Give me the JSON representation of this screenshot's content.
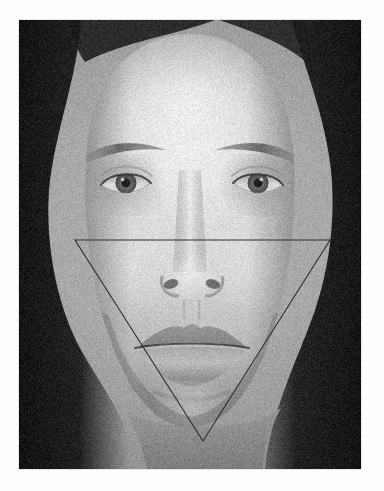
{
  "page": {
    "background_color": "#fdfdfd",
    "width": 384,
    "height": 491,
    "type": "annotated-photograph"
  },
  "photo": {
    "name": "frontal-face-portrait",
    "description": "Grayscale frontal portrait photograph of a woman's face, neutral expression, hair pulled back, dark background at left and right edges",
    "color_mode": "grayscale",
    "frame": {
      "x": 19,
      "y": 20,
      "width": 342,
      "height": 449
    },
    "border_color": "#c8c8c8",
    "tones": {
      "background_dark": "#1c1c1c",
      "hair_dark": "#232323",
      "skin_midtone": "#b9b9b9",
      "skin_highlight": "#e3e3e3",
      "shadow": "#7a7a7a"
    }
  },
  "overlay": {
    "name": "inverted-triangle-guide",
    "shape": "triangle",
    "orientation": "inverted",
    "stroke_color": "#2e2e2e",
    "stroke_width": 1.1,
    "fill": "none",
    "description": "Thin dark inverted triangle drawn from left temple/cheekbone across to right temple/cheekbone, converging down to a point below the chin",
    "vertices": [
      {
        "label": "left-temple",
        "x": 75,
        "y": 240
      },
      {
        "label": "right-temple",
        "x": 330,
        "y": 240
      },
      {
        "label": "chin-point",
        "x": 203,
        "y": 441
      }
    ]
  },
  "facial_landmarks": [
    {
      "name": "left-eye",
      "x": 126,
      "y": 184
    },
    {
      "name": "right-eye",
      "x": 258,
      "y": 184
    },
    {
      "name": "left-eyebrow",
      "x": 124,
      "y": 148
    },
    {
      "name": "right-eyebrow",
      "x": 260,
      "y": 148
    },
    {
      "name": "nose-tip",
      "x": 193,
      "y": 290
    },
    {
      "name": "mouth-center",
      "x": 193,
      "y": 348
    },
    {
      "name": "chin",
      "x": 193,
      "y": 415
    }
  ]
}
